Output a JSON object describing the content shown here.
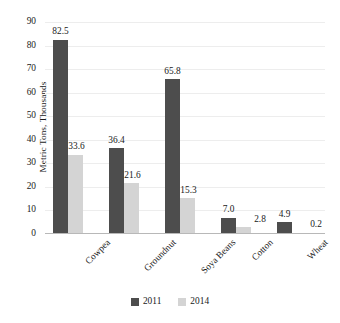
{
  "chart_data": {
    "type": "bar",
    "title": "",
    "subtitle": "",
    "xlabel": "",
    "ylabel": "Metric Tons, Thousands",
    "ylim": [
      0,
      90
    ],
    "ytick_step": 10,
    "yticks": [
      90,
      80,
      70,
      60,
      50,
      40,
      30,
      20,
      10,
      0
    ],
    "ytick_labels": [
      "90",
      "80",
      "70",
      "60",
      "50",
      "40",
      "30",
      "20",
      "10",
      "0"
    ],
    "grid": true,
    "grid_axis": "y",
    "legend_position": "bottom",
    "orientation": "vertical",
    "categories": [
      "Cowpea",
      "Groundnut",
      "Soya Beans",
      "Cotton",
      "Wheat"
    ],
    "series": [
      {
        "name": "2011",
        "color": "#4d4d4d",
        "values": [
          82.5,
          36.4,
          65.8,
          7.0,
          4.9
        ],
        "data_labels": [
          "82.5",
          "36.4",
          "65.8",
          "7.0",
          "4.9"
        ]
      },
      {
        "name": "2014",
        "color": "#d4d4d4",
        "values": [
          33.6,
          21.6,
          15.3,
          2.8,
          0.2
        ],
        "data_labels": [
          "33.6",
          "21.6",
          "15.3",
          "2.8",
          "0.2"
        ]
      }
    ]
  },
  "legend": {
    "items": [
      {
        "label": "2011",
        "color": "#4d4d4d"
      },
      {
        "label": "2014",
        "color": "#d4d4d4"
      }
    ]
  },
  "colors": {
    "series_2011": "#4d4d4d",
    "series_2014": "#d4d4d4",
    "gridline": "#ededed",
    "axis": "#b8b8b8",
    "text": "#1a1a1a",
    "background": "#ffffff"
  }
}
